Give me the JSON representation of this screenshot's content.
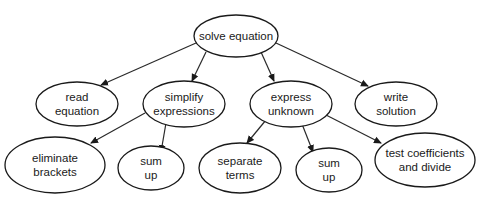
{
  "diagram": {
    "nodes": [
      {
        "id": "solve",
        "lines": [
          "solve equation"
        ],
        "cx": 236,
        "cy": 36,
        "rx": 42,
        "ry": 21
      },
      {
        "id": "read",
        "lines": [
          "read",
          "equation"
        ],
        "cx": 77,
        "cy": 104,
        "rx": 41,
        "ry": 22
      },
      {
        "id": "simplify",
        "lines": [
          "simplify",
          "expressions"
        ],
        "cx": 184,
        "cy": 104,
        "rx": 41,
        "ry": 23
      },
      {
        "id": "express",
        "lines": [
          "express",
          "unknown"
        ],
        "cx": 291,
        "cy": 104,
        "rx": 41,
        "ry": 23
      },
      {
        "id": "write",
        "lines": [
          "write",
          "solution"
        ],
        "cx": 396,
        "cy": 104,
        "rx": 41,
        "ry": 22
      },
      {
        "id": "eliminate",
        "lines": [
          "eliminate",
          "brackets"
        ],
        "cx": 55,
        "cy": 165,
        "rx": 50,
        "ry": 28
      },
      {
        "id": "sumup1",
        "lines": [
          "sum",
          "up"
        ],
        "cx": 151,
        "cy": 168,
        "rx": 33,
        "ry": 22
      },
      {
        "id": "separate",
        "lines": [
          "separate",
          "terms"
        ],
        "cx": 240,
        "cy": 168,
        "rx": 41,
        "ry": 25
      },
      {
        "id": "sumup2",
        "lines": [
          "sum",
          "up"
        ],
        "cx": 329,
        "cy": 170,
        "rx": 33,
        "ry": 22
      },
      {
        "id": "test",
        "lines": [
          "test coefficients",
          "and divide"
        ],
        "cx": 425,
        "cy": 160,
        "rx": 50,
        "ry": 27
      }
    ],
    "edges": [
      {
        "from": "solve",
        "to": "read",
        "x1": 196,
        "y1": 43,
        "x2": 101,
        "y2": 85
      },
      {
        "from": "solve",
        "to": "simplify",
        "x1": 206,
        "y1": 52,
        "x2": 192,
        "y2": 81
      },
      {
        "from": "solve",
        "to": "express",
        "x1": 261,
        "y1": 52,
        "x2": 274,
        "y2": 81
      },
      {
        "from": "solve",
        "to": "write",
        "x1": 276,
        "y1": 43,
        "x2": 368,
        "y2": 86
      },
      {
        "from": "simplify",
        "to": "eliminate",
        "x1": 145,
        "y1": 113,
        "x2": 91,
        "y2": 143
      },
      {
        "from": "simplify",
        "to": "sumup1",
        "x1": 166,
        "y1": 123,
        "x2": 161,
        "y2": 152
      },
      {
        "from": "express",
        "to": "separate",
        "x1": 266,
        "y1": 120,
        "x2": 247,
        "y2": 143
      },
      {
        "from": "express",
        "to": "sumup2",
        "x1": 302,
        "y1": 124,
        "x2": 313,
        "y2": 152
      },
      {
        "from": "express",
        "to": "test",
        "x1": 326,
        "y1": 115,
        "x2": 381,
        "y2": 143
      }
    ]
  }
}
